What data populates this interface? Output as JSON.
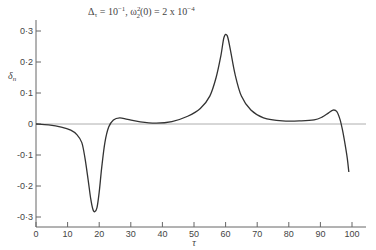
{
  "chart_data": {
    "type": "line",
    "title_parts": {
      "part1": "Δ",
      "part1_sub": "τ",
      "part2": " = 10",
      "part2_sup": "−1",
      "part3": ", ω",
      "part3_sup": "2",
      "part3_sub": "2",
      "part4": "(0) = 2 x 10",
      "part4_sup": "−4"
    },
    "xlabel": "τ",
    "ylabel": "δn",
    "ylabel_main": "δ",
    "ylabel_sub": "n",
    "xlim": [
      0,
      100
    ],
    "ylim": [
      -0.3,
      0.3
    ],
    "xticks": [
      "0",
      "10",
      "20",
      "30",
      "40",
      "50",
      "60",
      "70",
      "80",
      "90",
      "100"
    ],
    "yticks": [
      "0·3",
      "0·2",
      "0·1",
      "0",
      "-0·1",
      "-0·2",
      "-0·3"
    ],
    "ytick_values": [
      0.3,
      0.2,
      0.1,
      0,
      -0.1,
      -0.2,
      -0.3
    ],
    "grid": false,
    "legend": null,
    "zero_line": true,
    "series": [
      {
        "name": "δn",
        "x": [
          0,
          4,
          8,
          11,
          13,
          14.5,
          15.5,
          16.5,
          17.3,
          18,
          18.6,
          19.3,
          20,
          20.8,
          21.8,
          23,
          24.5,
          26.5,
          29,
          33,
          38,
          43,
          48,
          52,
          55,
          57,
          58.5,
          59.5,
          60.5,
          61.5,
          63,
          65,
          68,
          72,
          78,
          84,
          88,
          90.5,
          92.5,
          94,
          95.2,
          96.2,
          97,
          97.8,
          98.5,
          99
        ],
        "y": [
          0,
          -0.003,
          -0.01,
          -0.02,
          -0.035,
          -0.06,
          -0.11,
          -0.18,
          -0.24,
          -0.275,
          -0.283,
          -0.27,
          -0.22,
          -0.14,
          -0.06,
          -0.01,
          0.013,
          0.02,
          0.015,
          0.007,
          0.003,
          0.008,
          0.025,
          0.05,
          0.09,
          0.15,
          0.22,
          0.28,
          0.285,
          0.24,
          0.16,
          0.09,
          0.045,
          0.02,
          0.01,
          0.01,
          0.013,
          0.022,
          0.035,
          0.045,
          0.04,
          0.015,
          -0.02,
          -0.065,
          -0.11,
          -0.155
        ]
      }
    ]
  },
  "chart": {
    "line_color": "#333333",
    "axis_color": "#666666",
    "zero_line_color": "#999999"
  }
}
